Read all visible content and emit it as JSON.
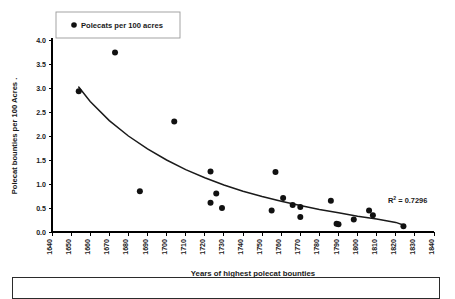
{
  "chart_data": {
    "type": "scatter",
    "title": "",
    "xlabel": "Years of highest polecat bounties",
    "ylabel": "Polecat bounties per 100 Acres  .",
    "xlim": [
      1640,
      1840
    ],
    "ylim": [
      0.0,
      4.0
    ],
    "xticks": [
      1640,
      1650,
      1660,
      1670,
      1680,
      1690,
      1700,
      1710,
      1720,
      1730,
      1740,
      1750,
      1760,
      1770,
      1780,
      1790,
      1800,
      1810,
      1820,
      1830,
      1840
    ],
    "yticks": [
      "0.0",
      "0.5",
      "1.0",
      "1.5",
      "2.0",
      "2.5",
      "3.0",
      "3.5",
      "4.0"
    ],
    "grid": false,
    "legend": {
      "position": "top-left",
      "entries": [
        {
          "label": "Polecats per 100 acres",
          "marker": "filled-circle",
          "color": "#111111"
        }
      ]
    },
    "series": [
      {
        "name": "Polecats per 100 acres",
        "marker": "filled-circle",
        "color": "#111111",
        "points": [
          {
            "x": 1654,
            "y": 2.93
          },
          {
            "x": 1673,
            "y": 3.74
          },
          {
            "x": 1686,
            "y": 0.85
          },
          {
            "x": 1704,
            "y": 2.3
          },
          {
            "x": 1723,
            "y": 1.26
          },
          {
            "x": 1723,
            "y": 0.61
          },
          {
            "x": 1726,
            "y": 0.8
          },
          {
            "x": 1729,
            "y": 0.5
          },
          {
            "x": 1755,
            "y": 0.45
          },
          {
            "x": 1757,
            "y": 1.25
          },
          {
            "x": 1761,
            "y": 0.71
          },
          {
            "x": 1766,
            "y": 0.56
          },
          {
            "x": 1770,
            "y": 0.52
          },
          {
            "x": 1770,
            "y": 0.31
          },
          {
            "x": 1786,
            "y": 0.65
          },
          {
            "x": 1789,
            "y": 0.17
          },
          {
            "x": 1790,
            "y": 0.16
          },
          {
            "x": 1798,
            "y": 0.26
          },
          {
            "x": 1806,
            "y": 0.45
          },
          {
            "x": 1808,
            "y": 0.35
          },
          {
            "x": 1824,
            "y": 0.12
          }
        ]
      }
    ],
    "trendline": {
      "type": "exponential",
      "r_squared": "0.7296",
      "annotation": "R",
      "annotation_sup": "2",
      "annotation_rest": " = 0.7296",
      "points": [
        {
          "x": 1654,
          "y": 3.02
        },
        {
          "x": 1660,
          "y": 2.72
        },
        {
          "x": 1670,
          "y": 2.32
        },
        {
          "x": 1680,
          "y": 2.0
        },
        {
          "x": 1690,
          "y": 1.73
        },
        {
          "x": 1700,
          "y": 1.5
        },
        {
          "x": 1710,
          "y": 1.3
        },
        {
          "x": 1720,
          "y": 1.13
        },
        {
          "x": 1730,
          "y": 0.98
        },
        {
          "x": 1740,
          "y": 0.85
        },
        {
          "x": 1750,
          "y": 0.74
        },
        {
          "x": 1760,
          "y": 0.64
        },
        {
          "x": 1770,
          "y": 0.55
        },
        {
          "x": 1780,
          "y": 0.47
        },
        {
          "x": 1790,
          "y": 0.4
        },
        {
          "x": 1800,
          "y": 0.33
        },
        {
          "x": 1810,
          "y": 0.27
        },
        {
          "x": 1820,
          "y": 0.2
        },
        {
          "x": 1825,
          "y": 0.13
        }
      ]
    }
  }
}
